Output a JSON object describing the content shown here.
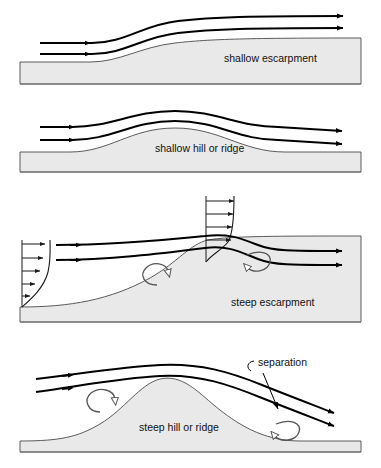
{
  "figure": {
    "type": "diagram",
    "background_color": "#ffffff",
    "terrain_fill": "#e9e9e9",
    "terrain_stroke": "#4a4a4a",
    "streamline_color": "#000000",
    "eddy_color": "#555555",
    "width": 381,
    "height": 468
  },
  "panels": [
    {
      "id": "shallow-escarpment",
      "label": "shallow escarpment",
      "label_x": 224,
      "label_y": 62,
      "streamline_count": 2,
      "has_velocity_profile": false,
      "has_separation_eddy": false
    },
    {
      "id": "shallow-hill-or-ridge",
      "label": "shallow hill or ridge",
      "label_x": 155,
      "label_y": 152,
      "streamline_count": 2,
      "has_velocity_profile": false,
      "has_separation_eddy": false
    },
    {
      "id": "steep-escarpment",
      "label": "steep escarpment",
      "label_x": 231,
      "label_y": 306,
      "streamline_count": 2,
      "has_velocity_profile": true,
      "velocity_profile_count": 2,
      "has_separation_eddy": true,
      "eddy_count": 2
    },
    {
      "id": "steep-hill-or-ridge",
      "label": "steep hill or ridge",
      "label_x": 139,
      "label_y": 431,
      "streamline_count": 2,
      "has_velocity_profile": false,
      "has_separation_eddy": true,
      "eddy_count": 2
    }
  ],
  "annotations": [
    {
      "id": "separation",
      "text": "separation",
      "x": 258,
      "y": 366,
      "points_to": "leeward-eddy"
    }
  ]
}
